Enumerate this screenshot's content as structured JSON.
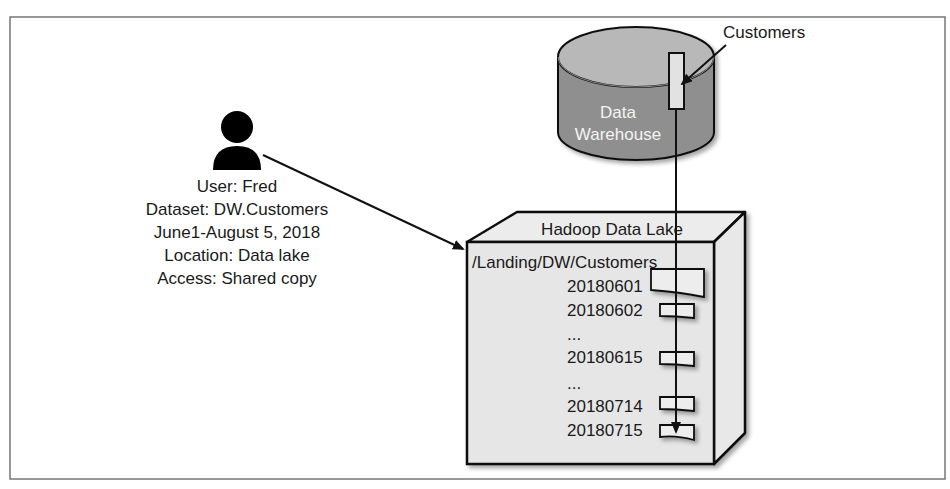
{
  "user": {
    "icon": "person-icon",
    "lines": [
      "User: Fred",
      "Dataset: DW.Customers",
      "June1-August 5, 2018",
      "Location: Data lake",
      "Access: Shared copy"
    ]
  },
  "warehouse": {
    "line1": "Data",
    "line2": "Warehouse",
    "table_label": "Customers"
  },
  "lake": {
    "title": "Hadoop Data Lake",
    "path": "/Landing/DW/Customers",
    "partitions": [
      {
        "label": "20180601"
      },
      {
        "label": "20180602"
      },
      {
        "label": "..."
      },
      {
        "label": "20180615"
      },
      {
        "label": "..."
      },
      {
        "label": "20180714"
      },
      {
        "label": "20180715"
      }
    ]
  },
  "colors": {
    "frame": "#777777",
    "cylinder_top": "#b8b8b8",
    "cylinder_body": "#8f8f8f",
    "box_face": "#e6e6e6",
    "stroke": "#111111"
  }
}
